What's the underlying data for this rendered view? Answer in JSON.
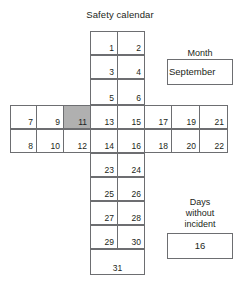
{
  "title": "Safety calendar",
  "colors": {
    "stroke": "#6d6e71",
    "text": "#231f20",
    "shaded_cell": "#b0b0b0",
    "background": "#ffffff"
  },
  "calendar": {
    "shape": "cross",
    "highlighted_day": "11",
    "top_column": [
      {
        "left": "1",
        "right": "2"
      },
      {
        "left": "3",
        "right": "4"
      },
      {
        "left": "5",
        "right": "6"
      }
    ],
    "middle_bar": {
      "left_wing": [
        {
          "top": "7",
          "bottom": "8"
        },
        {
          "top": "9",
          "bottom": "10"
        },
        {
          "top": "11",
          "bottom": "12"
        }
      ],
      "center": [
        {
          "top": "13",
          "bottom": "14"
        },
        {
          "top": "15",
          "bottom": "16"
        }
      ],
      "right_wing": [
        {
          "top": "17",
          "bottom": "18"
        },
        {
          "top": "19",
          "bottom": "20"
        },
        {
          "top": "21",
          "bottom": "22"
        }
      ]
    },
    "bottom_column": [
      {
        "left": "23",
        "right": "24"
      },
      {
        "left": "25",
        "right": "26"
      },
      {
        "left": "27",
        "right": "28"
      },
      {
        "left": "29",
        "right": "30"
      }
    ],
    "last_row": "31"
  },
  "month_panel": {
    "label": "Month",
    "value": "September"
  },
  "incident_panel": {
    "label_line1": "Days",
    "label_line2": "without",
    "label_line3": "incident",
    "value": "16"
  }
}
